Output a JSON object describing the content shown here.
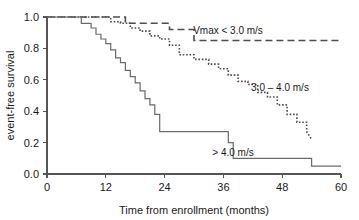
{
  "chart_data": {
    "type": "line",
    "title": "",
    "subtitle": "",
    "xlabel": "Time from enrollment (months)",
    "ylabel": "event-free survival",
    "xlim": [
      0,
      60
    ],
    "ylim": [
      0.0,
      1.0
    ],
    "xticks": [
      0,
      12,
      24,
      36,
      48,
      60
    ],
    "xticklabels": [
      "0",
      "12",
      "24",
      "36",
      "48",
      "60"
    ],
    "yticks": [
      0.0,
      0.2,
      0.4,
      0.6,
      0.8,
      1.0
    ],
    "yticklabels": [
      "0.0",
      "0.2",
      "0.4",
      "0.6",
      "0.8",
      "1.0"
    ],
    "grid": false,
    "legend_position": "inline-annotations",
    "step_type": "post",
    "series": [
      {
        "name": "Vmax < 3.0 m/s",
        "linestyle": "dashed",
        "color": "#4d4d4d",
        "annotation": "Vmax < 3.0 m/s",
        "x": [
          0,
          16,
          16,
          25,
          25,
          30,
          30,
          60
        ],
        "y": [
          1.0,
          1.0,
          0.96,
          0.96,
          0.92,
          0.92,
          0.85,
          0.85
        ]
      },
      {
        "name": "3.0 - 4.0 m/s",
        "linestyle": "dotted",
        "color": "#4d4d4d",
        "annotation": "3.0 – 4.0 m/s",
        "x": [
          0,
          13,
          13,
          15,
          15,
          17,
          17,
          19,
          19,
          21,
          21,
          23,
          23,
          25,
          25,
          27,
          27,
          30,
          30,
          33,
          33,
          35,
          35,
          37,
          37,
          39,
          39,
          41,
          41,
          43,
          43,
          45,
          45,
          47,
          47,
          49,
          49,
          51,
          51,
          53,
          53,
          54
        ],
        "y": [
          1.0,
          1.0,
          0.97,
          0.97,
          0.96,
          0.96,
          0.93,
          0.93,
          0.91,
          0.91,
          0.88,
          0.88,
          0.86,
          0.86,
          0.82,
          0.82,
          0.76,
          0.76,
          0.73,
          0.73,
          0.7,
          0.7,
          0.67,
          0.67,
          0.63,
          0.63,
          0.59,
          0.59,
          0.57,
          0.57,
          0.52,
          0.52,
          0.49,
          0.49,
          0.44,
          0.44,
          0.38,
          0.38,
          0.33,
          0.33,
          0.27,
          0.22
        ]
      },
      {
        "name": "> 4.0 m/s",
        "linestyle": "solid",
        "color": "#6b6b6b",
        "annotation": "> 4.0 m/s",
        "x": [
          0,
          7,
          7,
          9,
          9,
          10,
          10,
          11,
          11,
          12,
          12,
          13,
          13,
          14,
          14,
          15,
          15,
          16,
          16,
          17,
          17,
          18,
          18,
          19,
          19,
          20,
          20,
          21,
          21,
          22,
          22,
          23,
          23,
          37,
          37,
          38,
          38,
          54,
          54,
          60
        ],
        "y": [
          1.0,
          1.0,
          0.96,
          0.96,
          0.93,
          0.93,
          0.89,
          0.89,
          0.86,
          0.86,
          0.83,
          0.83,
          0.79,
          0.79,
          0.74,
          0.74,
          0.71,
          0.71,
          0.66,
          0.66,
          0.62,
          0.62,
          0.58,
          0.58,
          0.53,
          0.53,
          0.48,
          0.48,
          0.44,
          0.44,
          0.38,
          0.38,
          0.27,
          0.27,
          0.2,
          0.2,
          0.1,
          0.1,
          0.05,
          0.05
        ]
      }
    ]
  },
  "annotations": {
    "vmax_low": "Vmax < 3.0 m/s",
    "vmax_mid": "3.0 – 4.0 m/s",
    "vmax_high": "> 4.0 m/s"
  }
}
